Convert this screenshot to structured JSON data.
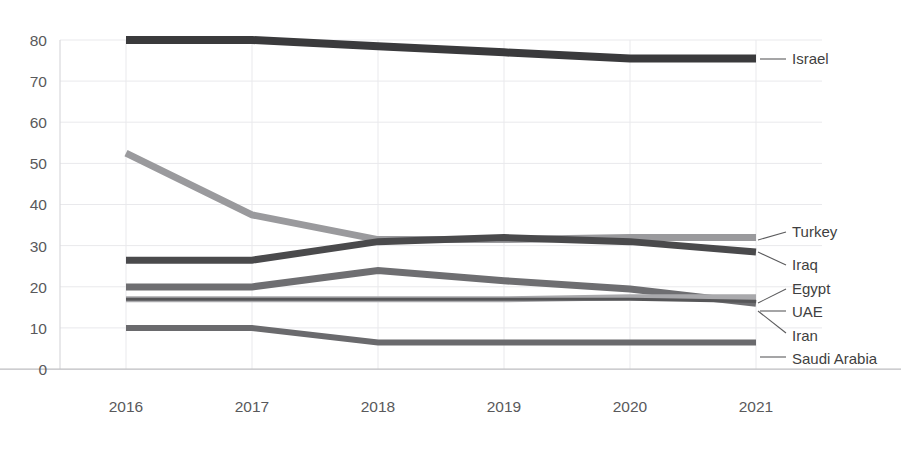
{
  "chart_title": "",
  "axis": {
    "y_ticks": [
      "0",
      "10",
      "20",
      "30",
      "40",
      "50",
      "60",
      "70",
      "80"
    ],
    "x_ticks": [
      "2016",
      "2017",
      "2018",
      "2019",
      "2020",
      "2021"
    ]
  },
  "series_labels": {
    "israel": "Israel",
    "turkey": "Turkey",
    "iraq": "Iraq",
    "egypt": "Egypt",
    "uae": "UAE",
    "iran": "Iran",
    "saudi_arabia": "Saudi Arabia"
  },
  "colors": {
    "israel": "#3a3a3c",
    "turkey": "#9a9a9d",
    "iraq": "#4a4a4c",
    "egypt": "#6e6e71",
    "uae": "#a9a9ac",
    "iran": "#575759",
    "saudi_arabia": "#6a6a6d",
    "gridline": "#e9e9ec",
    "axis": "#d9d9dc",
    "tick_text": "#59595b",
    "label_text": "#3f3f41"
  },
  "chart_data": {
    "type": "line",
    "title": "",
    "xlabel": "",
    "ylabel": "",
    "x": [
      2016,
      2017,
      2018,
      2019,
      2020,
      2021
    ],
    "ylim": [
      0,
      80
    ],
    "ytick_step": 10,
    "grid": true,
    "legend_position": "right-inline-labels",
    "series": [
      {
        "name": "Israel",
        "values": [
          80.0,
          80.0,
          78.5,
          77.0,
          75.5,
          75.5
        ]
      },
      {
        "name": "Turkey",
        "values": [
          52.5,
          37.5,
          31.5,
          31.5,
          32.0,
          32.0
        ]
      },
      {
        "name": "Iraq",
        "values": [
          26.5,
          26.5,
          31.0,
          32.0,
          31.0,
          28.5
        ]
      },
      {
        "name": "Egypt",
        "values": [
          20.0,
          20.0,
          24.0,
          21.5,
          19.5,
          16.0
        ]
      },
      {
        "name": "UAE",
        "values": [
          17.0,
          17.0,
          17.0,
          17.0,
          17.5,
          17.5
        ]
      },
      {
        "name": "Iran",
        "values": [
          17.0,
          17.0,
          17.0,
          17.0,
          17.0,
          16.5
        ]
      },
      {
        "name": "Saudi Arabia",
        "values": [
          10.0,
          10.0,
          6.5,
          6.5,
          6.5,
          6.5
        ]
      }
    ]
  }
}
